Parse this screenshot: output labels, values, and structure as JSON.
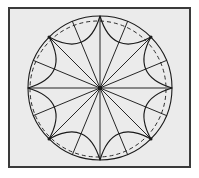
{
  "figure": {
    "canvas": {
      "width": 199,
      "height": 178
    },
    "background_color": "#ffffff",
    "frame": {
      "name": "figure-border",
      "x": 8,
      "y": 7,
      "width": 183,
      "height": 161,
      "fill_color": "#ebebeb",
      "stroke_color": "#3a3a3a",
      "stroke_width": 2.2
    },
    "center": {
      "x": 100,
      "y": 88
    },
    "hub": {
      "label": "center-point",
      "size": 4,
      "color": "#1a1a1a"
    },
    "outer_circle": {
      "label": "outer-circle-solid",
      "radius": 72,
      "stroke_color": "#1a1a1a",
      "stroke_width": 1.1,
      "dash": "none"
    },
    "inner_circle": {
      "label": "inner-circle-dashed",
      "radius": 68,
      "offset_x": -2,
      "offset_y": 1,
      "stroke_color": "#2b2b2b",
      "stroke_width": 1.0,
      "dash": "4 3"
    },
    "spokes": {
      "label": "radial-spokes",
      "count": 16,
      "step_degrees": 22.5,
      "start_degrees": 0,
      "radius": 72,
      "stroke_color": "#1a1a1a",
      "stroke_width": 0.95,
      "angles_degrees": [
        0,
        22.5,
        45,
        67.5,
        90,
        112.5,
        135,
        157.5,
        180,
        202.5,
        225,
        247.5,
        270,
        292.5,
        315,
        337.5
      ]
    },
    "arcs": {
      "label": "inward-scallop-arcs",
      "count": 16,
      "span_degrees": 45,
      "chord_radius": 72,
      "sagitta_ratio": 0.62,
      "stroke_color": "#1a1a1a",
      "stroke_width": 1.15,
      "fill": "none",
      "start_offset_degrees": 0
    },
    "node_markers": {
      "label": "arc-intersection-nodes",
      "radius": 1.6,
      "color": "#1a1a1a",
      "angles_degrees": [
        45,
        135,
        225,
        315
      ]
    }
  }
}
